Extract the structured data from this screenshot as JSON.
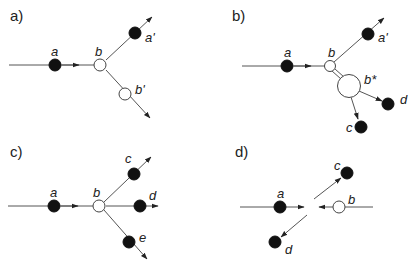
{
  "figure": {
    "panels": [
      {
        "id": "a",
        "label": "a)",
        "particles": {
          "a": "a",
          "b": "b",
          "a_prime": "a'",
          "b_prime": "b'"
        }
      },
      {
        "id": "b",
        "label": "b)",
        "particles": {
          "a": "a",
          "b": "b",
          "a_prime": "a'",
          "b_star": "b*",
          "c": "c",
          "d": "d"
        }
      },
      {
        "id": "c",
        "label": "c)",
        "particles": {
          "a": "a",
          "b": "b",
          "c": "c",
          "d": "d",
          "e": "e"
        }
      },
      {
        "id": "d",
        "label": "d)",
        "particles": {
          "a": "a",
          "b": "b",
          "c": "c",
          "d": "d"
        }
      }
    ],
    "colors": {
      "filled_particle": "#111111",
      "hollow_particle": "#ffffff",
      "line": "#555555"
    }
  }
}
